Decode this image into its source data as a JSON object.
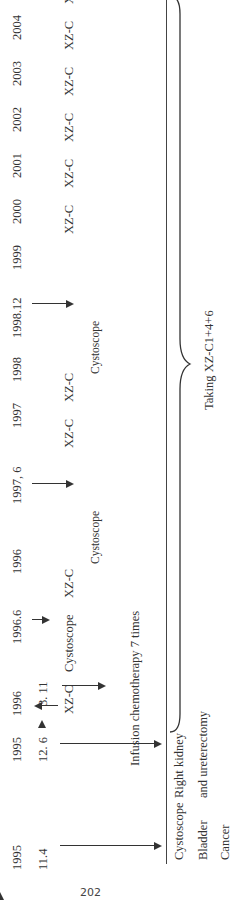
{
  "figure": {
    "orientation": "rotated-90-ccw",
    "timeline_labels": [
      {
        "year": "1995",
        "date": "11.4"
      },
      {
        "year": "1995",
        "date": "12. 6"
      },
      {
        "year": "1996",
        "date": "3. 11"
      },
      {
        "year": "1996.6",
        "date": ""
      },
      {
        "year": "1996",
        "date": ""
      },
      {
        "year": "1997, 6",
        "date": ""
      },
      {
        "year": "1997",
        "date": ""
      },
      {
        "year": "1998",
        "date": ""
      },
      {
        "year": "1998.12",
        "date": ""
      },
      {
        "year": "1999",
        "date": ""
      },
      {
        "year": "2000",
        "date": ""
      },
      {
        "year": "2001",
        "date": ""
      },
      {
        "year": "2002",
        "date": ""
      },
      {
        "year": "2003",
        "date": ""
      },
      {
        "year": "2004",
        "date": ""
      },
      {
        "year": "2005",
        "date": ""
      }
    ],
    "events_row": {
      "e1996_311": "XZ-C",
      "e1996_6": "Cystoscope",
      "e1996": "XZ-C",
      "e1997": "XZ-C",
      "e1998": "XZ-C",
      "e1999": "XZ-C",
      "e2000": "XZ-C",
      "e2001": "XZ-C",
      "e2002": "XZ-C",
      "e2003": "XZ-C",
      "e2004": "XZ-C",
      "e2005": "XZ-C"
    },
    "cystoscope_1997": "Cystoscope",
    "cystoscope_1998": "Cystoscope",
    "infusion": "Infusion chemotherapy 7 times",
    "below_axis": {
      "cystoscope": "Cystoscope",
      "bladder": "Bladder",
      "cancer": "Cancer",
      "right_kidney": "Right kidney",
      "ureterectomy": "and ureterectomy"
    },
    "brace_label": "Taking XZ-C1+4+6",
    "page_number": "202"
  }
}
